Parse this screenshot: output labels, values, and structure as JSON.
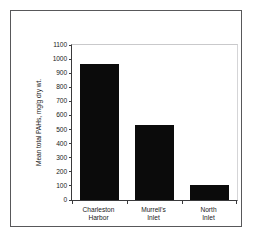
{
  "chart_data": {
    "type": "bar",
    "title": "",
    "subtitle": "",
    "xlabel": "",
    "ylabel": "Mean total PAHs, mg/g dry wt.",
    "categories": [
      "Charleston Harbor",
      "Murrell's Inlet",
      "North Inlet"
    ],
    "category_lines": [
      [
        "Charleston",
        "Harbor"
      ],
      [
        "Murrell's",
        "Inlet"
      ],
      [
        "North",
        "Inlet"
      ]
    ],
    "values": [
      965,
      530,
      108
    ],
    "ylim": [
      0,
      1100
    ],
    "ytick_step": 100,
    "yticks": [
      1100,
      1000,
      900,
      800,
      700,
      600,
      500,
      400,
      300,
      200,
      100,
      0
    ],
    "ytick_labels": [
      "1100",
      "1000",
      "900",
      "800",
      "700",
      "600",
      "500",
      "400",
      "300",
      "200",
      "100",
      "0"
    ],
    "grid": false,
    "legend": null,
    "legend_position": "none",
    "bar_color": "#0b0b0b",
    "axis_color": "#3a3a3c",
    "frame_color": "#58585a",
    "background_color": "#ffffff"
  }
}
